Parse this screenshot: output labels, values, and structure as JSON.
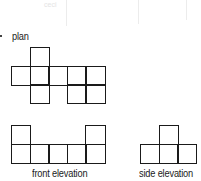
{
  "labels": {
    "plan": "plan",
    "front": "front elevation",
    "side": "side elevation",
    "ghost": "ceci"
  },
  "diagram": {
    "cell_size": 18.6,
    "plan": {
      "origin": [
        11,
        47
      ],
      "cells": [
        [
          1,
          0
        ],
        [
          0,
          1
        ],
        [
          1,
          1
        ],
        [
          2,
          1
        ],
        [
          3,
          1
        ],
        [
          4,
          1
        ],
        [
          1,
          2
        ],
        [
          3,
          2
        ],
        [
          4,
          2
        ]
      ]
    },
    "front_elevation": {
      "origin": [
        11,
        125
      ],
      "cells": [
        [
          0,
          0
        ],
        [
          4,
          0
        ],
        [
          0,
          1
        ],
        [
          1,
          1
        ],
        [
          2,
          1
        ],
        [
          3,
          1
        ],
        [
          4,
          1
        ]
      ]
    },
    "side_elevation": {
      "origin": [
        140,
        125
      ],
      "cells": [
        [
          1,
          0
        ],
        [
          0,
          1
        ],
        [
          1,
          1
        ],
        [
          2,
          1
        ]
      ]
    }
  }
}
